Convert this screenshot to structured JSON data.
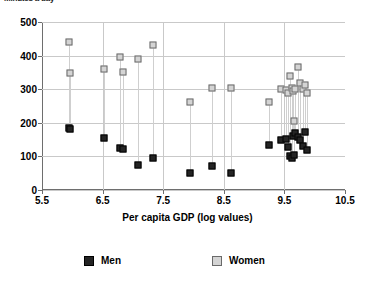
{
  "chart_data": {
    "type": "scatter",
    "title": "",
    "ylabel": "Minutes a day",
    "xlabel": "Per capita GDP (log values)",
    "xlim": [
      5.5,
      10.5
    ],
    "ylim": [
      0,
      500
    ],
    "xticks": [
      "5.5",
      "6.5",
      "7.5",
      "8.5",
      "9.5",
      "10.5"
    ],
    "yticks": [
      "0",
      "100",
      "200",
      "300",
      "400",
      "500"
    ],
    "grid": true,
    "legend_position": "bottom",
    "series": [
      {
        "name": "Men",
        "color": "#242424"
      },
      {
        "name": "Women",
        "color": "#d4d4d4"
      }
    ],
    "points": [
      {
        "x": 5.95,
        "men": 185,
        "women": 440
      },
      {
        "x": 5.97,
        "men": 182,
        "women": 348
      },
      {
        "x": 6.52,
        "men": 155,
        "women": 360
      },
      {
        "x": 6.78,
        "men": 124,
        "women": 395
      },
      {
        "x": 6.83,
        "men": 122,
        "women": 352
      },
      {
        "x": 7.08,
        "men": 75,
        "women": 390
      },
      {
        "x": 7.33,
        "men": 96,
        "women": 432
      },
      {
        "x": 7.95,
        "men": 52,
        "women": 262
      },
      {
        "x": 8.3,
        "men": 70,
        "women": 305
      },
      {
        "x": 8.62,
        "men": 52,
        "women": 305
      },
      {
        "x": 9.25,
        "men": 133,
        "women": 263
      },
      {
        "x": 9.45,
        "men": 148,
        "women": 300
      },
      {
        "x": 9.52,
        "men": 152,
        "women": 297
      },
      {
        "x": 9.56,
        "men": 128,
        "women": 290
      },
      {
        "x": 9.6,
        "men": 100,
        "women": 340
      },
      {
        "x": 9.62,
        "men": 96,
        "women": 305
      },
      {
        "x": 9.64,
        "men": 160,
        "women": 296
      },
      {
        "x": 9.66,
        "men": 104,
        "women": 205
      },
      {
        "x": 9.68,
        "men": 170,
        "women": 300
      },
      {
        "x": 9.72,
        "men": 158,
        "women": 365
      },
      {
        "x": 9.76,
        "men": 150,
        "women": 318
      },
      {
        "x": 9.8,
        "men": 132,
        "women": 300
      },
      {
        "x": 9.84,
        "men": 172,
        "women": 312
      },
      {
        "x": 9.88,
        "men": 120,
        "women": 288
      }
    ]
  },
  "legend": {
    "men_label": "Men",
    "women_label": "Women"
  }
}
